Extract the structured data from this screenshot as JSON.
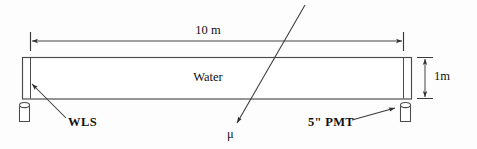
{
  "figure": {
    "background_color": "#fdfdfd",
    "line_color": "#3a3a3a",
    "text_color": "#111111"
  },
  "labels": {
    "length_dimension": "10 m",
    "height_dimension": "1m",
    "medium": "Water",
    "wls": "WLS",
    "pmt": "5\" PMT",
    "muon": "μ"
  },
  "annotations": {
    "length_dimension_name": "tank-length",
    "height_dimension_name": "tank-height",
    "medium_name": "tank-fill-medium",
    "wls_name": "wavelength-shifter-plate",
    "pmt_name": "photomultiplier-tube",
    "muon_name": "muon-track"
  },
  "geometry": {
    "tank": {
      "x": 22,
      "y": 57,
      "width": 390,
      "height": 42
    },
    "wls_plate_x": 30,
    "pmt_plate_x": 404,
    "length_arrow": {
      "x1": 30,
      "x2": 403,
      "y": 41
    },
    "height_arrow": {
      "x": 425,
      "y1": 57,
      "y2": 99
    },
    "left_pmt_cylinder": {
      "x": 19,
      "y": 102,
      "width": 11,
      "height": 20
    },
    "right_pmt_cylinder": {
      "x": 400,
      "y": 102,
      "width": 11,
      "height": 20
    },
    "muon_track": {
      "x1": 305,
      "y1": 5,
      "x2": 236,
      "y2": 124
    },
    "wls_pointer": {
      "x1": 66,
      "y1": 118,
      "x2": 31,
      "y2": 83
    },
    "pmt_pointer": {
      "x1": 352,
      "y1": 120,
      "x2": 396,
      "y2": 108
    }
  }
}
